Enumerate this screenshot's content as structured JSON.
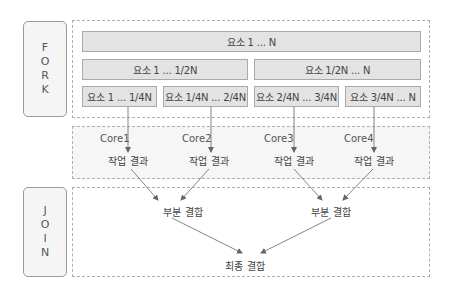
{
  "fork": {
    "label_letters": [
      "F",
      "O",
      "R",
      "K"
    ],
    "full": "요소 1 ... N",
    "halves": [
      "요소 1 ... 1/2N",
      "요소 1/2N ... N"
    ],
    "quarters": [
      "요소 1 ... 1/4N",
      "요소 1/4N ... 2/4N",
      "요소 2/4N ... 3/4N",
      "요소 3/4N ... N"
    ]
  },
  "cores": {
    "labels": [
      "Core1",
      "Core2",
      "Core3",
      "Core4"
    ],
    "results": [
      "작업 결과",
      "작업 결과",
      "작업 결과",
      "작업 결과"
    ]
  },
  "join": {
    "label_letters": [
      "J",
      "O",
      "I",
      "N"
    ],
    "partials": [
      "부분 결합",
      "부분 결합"
    ],
    "final": "최종 결합"
  },
  "colors": {
    "box_fill": "#e3e3e3",
    "box_border": "#a9a9a9",
    "line": "#777777",
    "core_area_fill": "#f6f6f6"
  }
}
